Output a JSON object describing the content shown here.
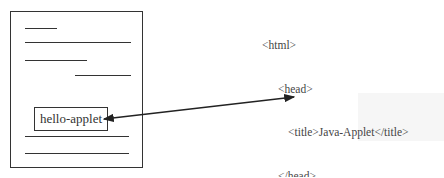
{
  "page_mockup": {
    "applet_label": "hello-applet"
  },
  "code": {
    "lines": [
      {
        "indent": 0,
        "text": "<html>"
      },
      {
        "indent": 1,
        "text": "<head>"
      },
      {
        "indent": 2,
        "text": "<title>Java-Applet</title>"
      },
      {
        "indent": 1,
        "text": "</head>"
      },
      {
        "indent": 1,
        "text": "<body>"
      },
      {
        "indent": 2,
        "text": "……"
      },
      {
        "indent": 2,
        "text": "<applet code=“hello.class”"
      },
      {
        "indent": 3,
        "text": "width=“100”"
      },
      {
        "indent": 3,
        "text": "height=“60”>"
      },
      {
        "indent": 1,
        "text": "</applet>"
      },
      {
        "indent": 2,
        "text": "……"
      },
      {
        "indent": 1,
        "text": "</body>"
      },
      {
        "indent": 0,
        "text": "</html>"
      }
    ]
  },
  "arrow": {
    "type": "double-headed",
    "from": "hello-applet box",
    "to": "<applet> tag"
  },
  "colors": {
    "stroke": "#333333",
    "text": "#444444"
  }
}
